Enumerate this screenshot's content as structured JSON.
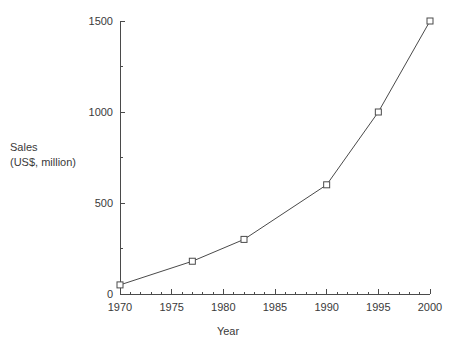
{
  "chart_data": {
    "type": "line",
    "title": "",
    "xlabel": "Year",
    "ylabel": "Sales\n(US$, million)",
    "ylabel_line1": "Sales",
    "ylabel_line2": "(US$, million)",
    "x": [
      1970,
      1977,
      1982,
      1990,
      1995,
      2000
    ],
    "values": [
      50,
      180,
      300,
      600,
      1000,
      1500
    ],
    "series": [
      {
        "name": "Sales",
        "x": [
          1970,
          1977,
          1982,
          1990,
          1995,
          2000
        ],
        "values": [
          50,
          180,
          300,
          600,
          1000,
          1500
        ]
      }
    ],
    "xlim": [
      1970,
      2000
    ],
    "ylim": [
      0,
      1500
    ],
    "xticks": [
      1970,
      1975,
      1980,
      1985,
      1990,
      1995,
      2000
    ],
    "xtick_labels": [
      "1970",
      "1975",
      "1980",
      "1985",
      "1990",
      "1995",
      "2000"
    ],
    "x_minor_tick_interval": 1,
    "yticks": [
      0,
      500,
      1000,
      1500
    ],
    "ytick_labels": [
      "0",
      "500",
      "1000",
      "1500"
    ],
    "y_minor_ticks": [
      250,
      750,
      1250
    ],
    "grid": false,
    "legend": false,
    "legend_position": "none",
    "marker": "open-square",
    "line_color": "#4a4a4a",
    "marker_color": "#4a4a4a",
    "axis_color": "#4a4a4a",
    "text_color": "#3a3a3a",
    "background_color": "#ffffff"
  }
}
